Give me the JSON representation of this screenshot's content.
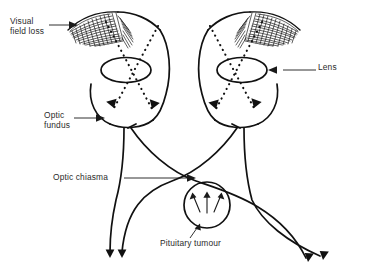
{
  "figure": {
    "background_color": "#ffffff",
    "ink_color": "#111111",
    "label_color": "#2b2b2b"
  },
  "labels": {
    "visual_field_loss": "Visual\nfield loss",
    "visual_field_loss_line1": "Visual",
    "visual_field_loss_line2": "field loss",
    "lens": "Lens",
    "optic_fundus": "Optic\nfundus",
    "optic_fundus_line1": "Optic",
    "optic_fundus_line2": "fundus",
    "optic_chiasma": "Optic chiasma",
    "pituitary_tumour": "Pituitary tumour"
  },
  "structures": [
    {
      "name": "left-eye",
      "parts": [
        "cornea-arc",
        "lens-ellipse",
        "globe-outline",
        "optic-nerve-head"
      ]
    },
    {
      "name": "right-eye",
      "parts": [
        "cornea-arc",
        "lens-ellipse",
        "globe-outline",
        "optic-nerve-head"
      ]
    },
    {
      "name": "optic-chiasma",
      "parts": [
        "crossing-nerve-fibres"
      ]
    },
    {
      "name": "pituitary-tumour",
      "parts": [
        "tumour-circle",
        "pressure-arrows"
      ]
    },
    {
      "name": "optic-tracts",
      "parts": [
        "left-tract-pair",
        "right-tract-pair"
      ]
    }
  ],
  "annotations": {
    "field_loss_regions": 2,
    "light_rays_per_eye": 2,
    "tumour_pressure_arrows": 3,
    "optic_tract_arrows": 4
  }
}
